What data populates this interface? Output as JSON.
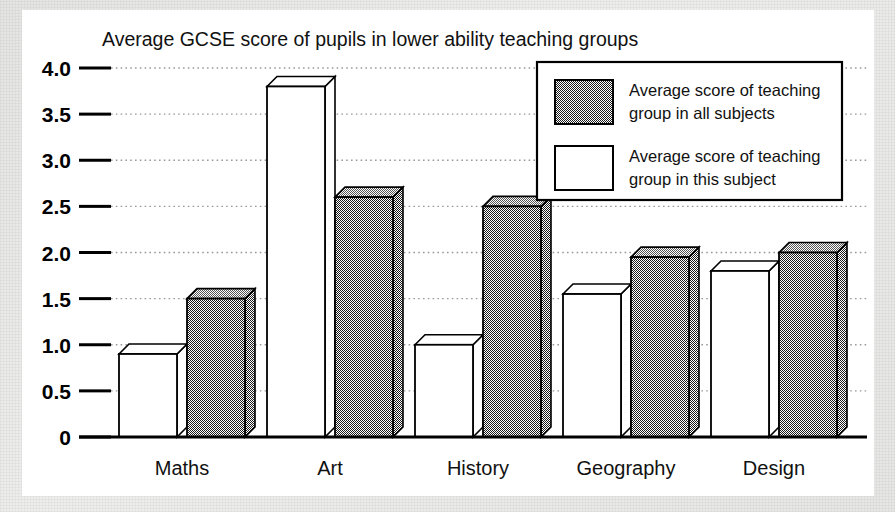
{
  "chart_data": {
    "type": "bar",
    "title": "Average GCSE score of pupils in lower ability teaching groups",
    "xlabel": "",
    "ylabel": "",
    "ylim": [
      0,
      4.0
    ],
    "yticks": [
      "0",
      "0.5",
      "1.0",
      "1.5",
      "2.0",
      "2.5",
      "3.0",
      "3.5",
      "4.0"
    ],
    "ytick_values": [
      0,
      0.5,
      1.0,
      1.5,
      2.0,
      2.5,
      3.0,
      3.5,
      4.0
    ],
    "grid": true,
    "legend_position": "top-right",
    "categories": [
      "Maths",
      "Art",
      "History",
      "Geography",
      "Design"
    ],
    "series": [
      {
        "name": "Average score of teaching group in this subject",
        "style": "white",
        "values": [
          0.9,
          3.8,
          1.0,
          1.55,
          1.8
        ]
      },
      {
        "name": "Average score of teaching group in all subjects",
        "style": "shaded",
        "values": [
          1.5,
          2.6,
          2.5,
          1.95,
          2.0
        ]
      }
    ]
  },
  "chart": {
    "title": "Average GCSE score of pupils in lower ability teaching groups",
    "yticks": [
      {
        "label": "4.0",
        "value": 4.0
      },
      {
        "label": "3.5",
        "value": 3.5
      },
      {
        "label": "3.0",
        "value": 3.0
      },
      {
        "label": "2.5",
        "value": 2.5
      },
      {
        "label": "2.0",
        "value": 2.0
      },
      {
        "label": "1.5",
        "value": 1.5
      },
      {
        "label": "1.0",
        "value": 1.0
      },
      {
        "label": "0.5",
        "value": 0.5
      },
      {
        "label": "0",
        "value": 0
      }
    ],
    "categories": [
      {
        "label": "Maths",
        "white": 0.9,
        "shaded": 1.5
      },
      {
        "label": "Art",
        "white": 3.8,
        "shaded": 2.6
      },
      {
        "label": "History",
        "white": 1.0,
        "shaded": 2.5
      },
      {
        "label": "Geography",
        "white": 1.55,
        "shaded": 1.95
      },
      {
        "label": "Design",
        "white": 1.8,
        "shaded": 2.0
      }
    ],
    "legend": [
      {
        "swatch": "shaded",
        "line1": "Average score of teaching",
        "line2": "group in all subjects"
      },
      {
        "swatch": "white",
        "line1": "Average score of teaching",
        "line2": "group in this subject"
      }
    ]
  },
  "colors": {
    "ink": "#000000",
    "paper": "#ffffff",
    "shaded_fill": "#808080",
    "gridline": "#999999"
  }
}
